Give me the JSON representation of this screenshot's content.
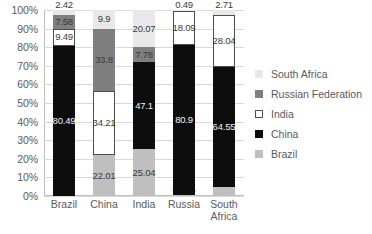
{
  "chart_data": {
    "type": "bar",
    "title": "",
    "xlabel": "",
    "ylabel": "",
    "stacked": true,
    "percent_stacked": true,
    "ylim": [
      0,
      100
    ],
    "grid": true,
    "legend_position": "right",
    "categories": [
      "Brazil",
      "China",
      "India",
      "Russia",
      "South Africa"
    ],
    "y_ticks": [
      "0%",
      "10%",
      "20%",
      "30%",
      "40%",
      "50%",
      "60%",
      "70%",
      "80%",
      "90%",
      "100%"
    ],
    "series": [
      {
        "name": "Brazil",
        "color": "#bfbfbf",
        "values": [
          0,
          22.01,
          25.04,
          0.495,
          4.7
        ],
        "labels": [
          "",
          "22.01",
          "25.04",
          "0.495",
          "4.7"
        ]
      },
      {
        "name": "China",
        "color": "#0d0d0d",
        "values": [
          80.49,
          0,
          47.1,
          80.9,
          64.55
        ],
        "labels": [
          "80.49",
          "",
          "47.1",
          "80.9",
          "64.55"
        ]
      },
      {
        "name": "India",
        "color": "#ffffff",
        "values": [
          9.49,
          34.21,
          0,
          18.09,
          28.04
        ],
        "labels": [
          "9.49",
          "34.21",
          "",
          "18.09",
          "28.04"
        ]
      },
      {
        "name": "Russian Federation",
        "color": "#7f7f7f",
        "values": [
          7.58,
          33.8,
          7.78,
          0,
          0
        ],
        "labels": [
          "7.58",
          "33.8",
          "7.78",
          "",
          ""
        ]
      },
      {
        "name": "South Africa",
        "color": "#e8e8e8",
        "values": [
          2.42,
          9.9,
          20.07,
          0.49,
          2.71
        ],
        "labels": [
          "2.42",
          "9.9",
          "20.07",
          "0.49",
          "2.71"
        ]
      }
    ],
    "legend_entries": [
      "South Africa",
      "Russian Federation",
      "India",
      "China",
      "Brazil"
    ]
  }
}
